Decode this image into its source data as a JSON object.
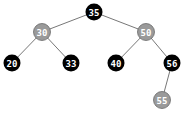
{
  "diagram": {
    "type": "red-black-tree",
    "colors": {
      "black_fill": "#000000",
      "black_text": "#ffffff",
      "gray_fill": "#9a9a9a",
      "gray_stroke": "#6a6a6a",
      "gray_text": "#ffffff",
      "edge": "#777777"
    },
    "nodes": [
      {
        "id": "n35",
        "label": "35",
        "color": "black",
        "x": 94,
        "y": 12
      },
      {
        "id": "n30",
        "label": "30",
        "color": "gray",
        "x": 42,
        "y": 32
      },
      {
        "id": "n50",
        "label": "50",
        "color": "gray",
        "x": 146,
        "y": 32
      },
      {
        "id": "n20",
        "label": "20",
        "color": "black",
        "x": 12,
        "y": 63
      },
      {
        "id": "n33",
        "label": "33",
        "color": "black",
        "x": 71,
        "y": 63
      },
      {
        "id": "n40",
        "label": "40",
        "color": "black",
        "x": 116,
        "y": 63
      },
      {
        "id": "n56",
        "label": "56",
        "color": "black",
        "x": 172,
        "y": 63
      },
      {
        "id": "n55",
        "label": "55",
        "color": "gray",
        "x": 162,
        "y": 100
      }
    ],
    "edges": [
      {
        "from": "35",
        "to": "30"
      },
      {
        "from": "35",
        "to": "50"
      },
      {
        "from": "30",
        "to": "20"
      },
      {
        "from": "30",
        "to": "33"
      },
      {
        "from": "50",
        "to": "40"
      },
      {
        "from": "50",
        "to": "56"
      },
      {
        "from": "56",
        "to": "55"
      }
    ]
  }
}
